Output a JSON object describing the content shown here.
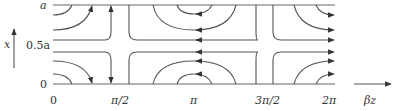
{
  "diagram": {
    "type": "field-line plot",
    "y_axis": {
      "label": "x",
      "ticks": [
        "0",
        "0.5a",
        "a"
      ]
    },
    "x_axis": {
      "label": "βz",
      "ticks": [
        "0",
        "π/2",
        "π",
        "3π/2",
        "2π"
      ]
    },
    "colors": {
      "lines": "#555555",
      "text": "#333333",
      "background": "#ffffff"
    }
  }
}
